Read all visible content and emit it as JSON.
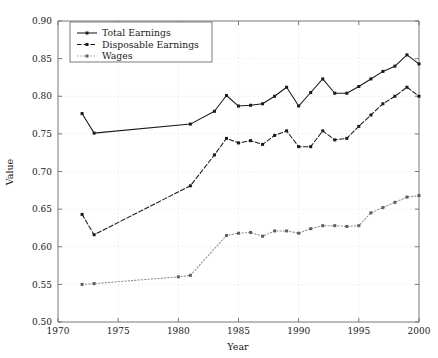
{
  "chart_data": {
    "type": "line",
    "title": "",
    "xlabel": "Year",
    "ylabel": "Value",
    "xlim": [
      1970,
      2000
    ],
    "ylim": [
      0.5,
      0.9
    ],
    "xticks": [
      1970,
      1975,
      1980,
      1985,
      1990,
      1995,
      2000
    ],
    "xticklabels": [
      "1970",
      "1975",
      "1980",
      "1985",
      "1990",
      "1995",
      "2000"
    ],
    "yticks": [
      0.5,
      0.55,
      0.6,
      0.65,
      0.7,
      0.75,
      0.8,
      0.85,
      0.9
    ],
    "yticklabels": [
      "0.50",
      "0.55",
      "0.60",
      "0.65",
      "0.70",
      "0.75",
      "0.80",
      "0.85",
      "0.90"
    ],
    "grid": true,
    "legend_position": "upper left",
    "series": [
      {
        "name": "Total Earnings",
        "style": "solid",
        "marker": "filled-square",
        "color": "#1a1a1a",
        "x": [
          1972,
          1973,
          1981,
          1983,
          1984,
          1985,
          1986,
          1987,
          1988,
          1989,
          1990,
          1991,
          1992,
          1993,
          1994,
          1995,
          1996,
          1997,
          1998,
          1999,
          2000
        ],
        "values": [
          0.777,
          0.751,
          0.763,
          0.78,
          0.801,
          0.787,
          0.788,
          0.79,
          0.8,
          0.812,
          0.787,
          0.805,
          0.823,
          0.804,
          0.804,
          0.813,
          0.823,
          0.833,
          0.84,
          0.855,
          0.843
        ]
      },
      {
        "name": "Disposable Earnings",
        "style": "dashed",
        "marker": "filled-square",
        "color": "#1a1a1a",
        "x": [
          1972,
          1973,
          1981,
          1983,
          1984,
          1985,
          1986,
          1987,
          1988,
          1989,
          1990,
          1991,
          1992,
          1993,
          1994,
          1995,
          1996,
          1997,
          1998,
          1999,
          2000
        ],
        "values": [
          0.643,
          0.616,
          0.681,
          0.722,
          0.744,
          0.738,
          0.741,
          0.736,
          0.748,
          0.754,
          0.733,
          0.733,
          0.754,
          0.742,
          0.744,
          0.76,
          0.775,
          0.79,
          0.8,
          0.812,
          0.8
        ]
      },
      {
        "name": "Wages",
        "style": "dotted",
        "marker": "filled-square",
        "color": "#8d8d8d",
        "x": [
          1972,
          1973,
          1980,
          1981,
          1984,
          1985,
          1986,
          1987,
          1988,
          1989,
          1990,
          1991,
          1992,
          1993,
          1994,
          1995,
          1996,
          1997,
          1998,
          1999,
          2000
        ],
        "values": [
          0.55,
          0.551,
          0.56,
          0.562,
          0.615,
          0.618,
          0.619,
          0.614,
          0.621,
          0.621,
          0.618,
          0.624,
          0.628,
          0.628,
          0.627,
          0.628,
          0.645,
          0.652,
          0.659,
          0.666,
          0.668
        ]
      }
    ]
  },
  "legend": {
    "entries": [
      {
        "label": "Total Earnings"
      },
      {
        "label": "Disposable Earnings"
      },
      {
        "label": "Wages"
      }
    ]
  }
}
